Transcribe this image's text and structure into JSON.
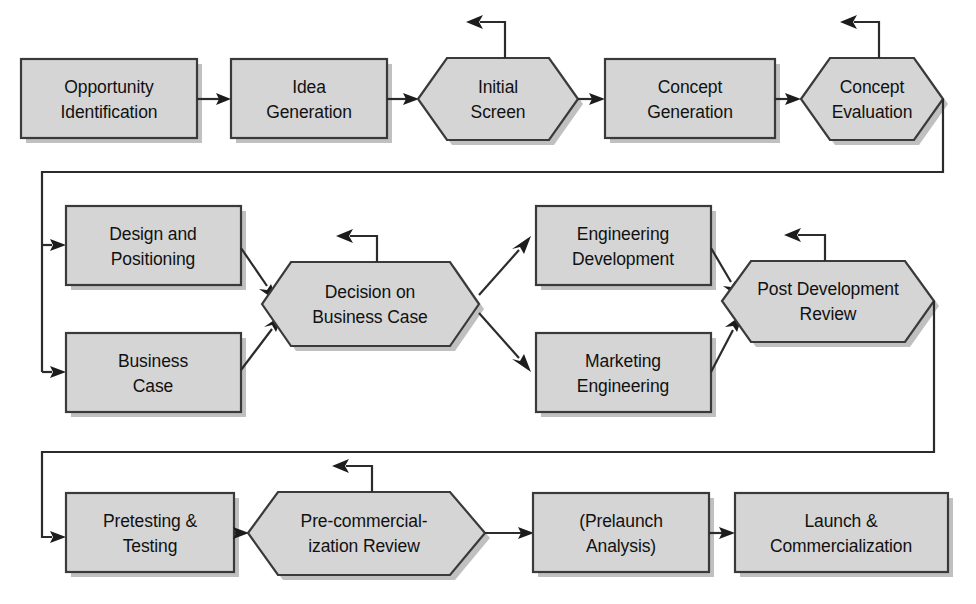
{
  "diagram": {
    "canvas": {
      "width": 976,
      "height": 604
    },
    "colors": {
      "node_fill": "#d5d5d5",
      "node_stroke": "#3a3a3a",
      "node_shadow": "#8d8d8d",
      "line": "#2b2b2b",
      "text": "#111111",
      "background": "#ffffff"
    },
    "rows": [
      {
        "name": "row-1-concept-stage",
        "nodes": [
          "opportunity-identification",
          "idea-generation",
          "initial-screen",
          "concept-generation",
          "concept-evaluation"
        ]
      },
      {
        "name": "row-2-development-stage",
        "nodes": [
          "design-and-positioning",
          "business-case",
          "decision-on-business-case",
          "engineering-development",
          "marketing-engineering",
          "post-development-review"
        ]
      },
      {
        "name": "row-3-launch-stage",
        "nodes": [
          "pretesting-and-testing",
          "pre-commercialization-review",
          "prelaunch-analysis",
          "launch-and-commercialization"
        ]
      }
    ],
    "nodes": {
      "opportunity_identification": {
        "id": "opportunity-identification",
        "shape": "rectangle",
        "line1": "Opportunity",
        "line2": "Identification"
      },
      "idea_generation": {
        "id": "idea-generation",
        "shape": "rectangle",
        "line1": "Idea",
        "line2": "Generation"
      },
      "initial_screen": {
        "id": "initial-screen",
        "shape": "hexagon",
        "line1": "Initial",
        "line2": "Screen",
        "has_rework_loop": true
      },
      "concept_generation": {
        "id": "concept-generation",
        "shape": "rectangle",
        "line1": "Concept",
        "line2": "Generation"
      },
      "concept_evaluation": {
        "id": "concept-evaluation",
        "shape": "hexagon",
        "line1": "Concept",
        "line2": "Evaluation",
        "has_rework_loop": true
      },
      "design_and_positioning": {
        "id": "design-and-positioning",
        "shape": "rectangle",
        "line1": "Design and",
        "line2": "Positioning"
      },
      "business_case": {
        "id": "business-case",
        "shape": "rectangle",
        "line1": "Business",
        "line2": "Case"
      },
      "decision_on_business_case": {
        "id": "decision-on-business-case",
        "shape": "hexagon",
        "line1": "Decision on",
        "line2": "Business Case",
        "has_rework_loop": true
      },
      "engineering_development": {
        "id": "engineering-development",
        "shape": "rectangle",
        "line1": "Engineering",
        "line2": "Development"
      },
      "marketing_engineering": {
        "id": "marketing-engineering",
        "shape": "rectangle",
        "line1": "Marketing",
        "line2": "Engineering"
      },
      "post_development_review": {
        "id": "post-development-review",
        "shape": "hexagon",
        "line1": "Post Development",
        "line2": "Review",
        "has_rework_loop": true
      },
      "pretesting_and_testing": {
        "id": "pretesting-and-testing",
        "shape": "rectangle",
        "line1": "Pretesting &",
        "line2": "Testing"
      },
      "pre_commercialization_review": {
        "id": "pre-commercialization-review",
        "shape": "hexagon",
        "line1": "Pre-commercial-",
        "line2": "ization Review",
        "has_rework_loop": true
      },
      "prelaunch_analysis": {
        "id": "prelaunch-analysis",
        "shape": "rectangle",
        "line1": "(Prelaunch",
        "line2": "Analysis)"
      },
      "launch_and_commercialization": {
        "id": "launch-and-commercialization",
        "shape": "rectangle",
        "line1": "Launch &",
        "line2": "Commercialization"
      }
    },
    "connections": [
      {
        "from": "opportunity-identification",
        "to": "idea-generation",
        "kind": "arrow-right"
      },
      {
        "from": "idea-generation",
        "to": "initial-screen",
        "kind": "arrow-right"
      },
      {
        "from": "initial-screen",
        "to": "concept-generation",
        "kind": "arrow-right"
      },
      {
        "from": "concept-generation",
        "to": "concept-evaluation",
        "kind": "arrow-right"
      },
      {
        "from": "concept-evaluation",
        "to": "design-and-positioning",
        "kind": "wrap-down-left-branch"
      },
      {
        "from": "concept-evaluation",
        "to": "business-case",
        "kind": "wrap-down-left-branch"
      },
      {
        "from": "design-and-positioning",
        "to": "decision-on-business-case",
        "kind": "arrow-diagonal-down"
      },
      {
        "from": "business-case",
        "to": "decision-on-business-case",
        "kind": "arrow-diagonal-up"
      },
      {
        "from": "decision-on-business-case",
        "to": "engineering-development",
        "kind": "arrow-diagonal-up"
      },
      {
        "from": "decision-on-business-case",
        "to": "marketing-engineering",
        "kind": "arrow-diagonal-down"
      },
      {
        "from": "engineering-development",
        "to": "post-development-review",
        "kind": "arrow-diagonal-down"
      },
      {
        "from": "marketing-engineering",
        "to": "post-development-review",
        "kind": "arrow-diagonal-up"
      },
      {
        "from": "post-development-review",
        "to": "pretesting-and-testing",
        "kind": "wrap-down-left"
      },
      {
        "from": "pretesting-and-testing",
        "to": "pre-commercialization-review",
        "kind": "arrow-right"
      },
      {
        "from": "pre-commercialization-review",
        "to": "prelaunch-analysis",
        "kind": "arrow-right"
      },
      {
        "from": "prelaunch-analysis",
        "to": "launch-and-commercialization",
        "kind": "arrow-right"
      }
    ],
    "rework_loops": [
      {
        "at": "initial-screen",
        "label": ""
      },
      {
        "at": "concept-evaluation",
        "label": ""
      },
      {
        "at": "decision-on-business-case",
        "label": ""
      },
      {
        "at": "post-development-review",
        "label": ""
      },
      {
        "at": "pre-commercialization-review",
        "label": ""
      }
    ]
  }
}
